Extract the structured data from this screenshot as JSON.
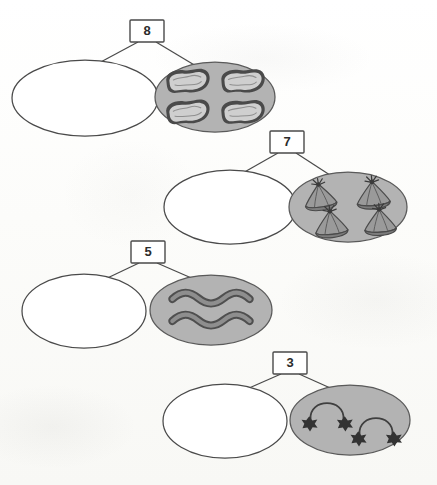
{
  "page": {
    "kind": "number-bond-worksheet",
    "background_color": "#fdfdfb",
    "ink_color": "#3a3a3a",
    "shaded_group_fill": "#b3b3b3",
    "empty_group_fill": "#ffffff"
  },
  "bonds": [
    {
      "id": "bond-8",
      "total": "8",
      "total_box": {
        "x": 130,
        "y": 20,
        "width": 34,
        "height": 22
      },
      "empty_part": {
        "cx": 85,
        "cy": 98,
        "rx": 73,
        "ry": 38,
        "label": ""
      },
      "shaded_part": {
        "cx": 215,
        "cy": 97,
        "rx": 60,
        "ry": 35,
        "icon": "bean-pastry-icon",
        "count": 4,
        "objects": [
          {
            "cx": 188,
            "cy": 82
          },
          {
            "cx": 243,
            "cy": 82
          },
          {
            "cx": 188,
            "cy": 113
          },
          {
            "cx": 243,
            "cy": 113
          }
        ]
      }
    },
    {
      "id": "bond-7",
      "total": "7",
      "total_box": {
        "x": 270,
        "y": 131,
        "width": 34,
        "height": 22
      },
      "empty_part": {
        "cx": 230,
        "cy": 207,
        "rx": 66,
        "ry": 37,
        "label": ""
      },
      "shaded_part": {
        "cx": 348,
        "cy": 207,
        "rx": 59,
        "ry": 35,
        "icon": "cone-bundle-icon",
        "count": 4,
        "objects": [
          {
            "cx": 320,
            "cy": 194
          },
          {
            "cx": 372,
            "cy": 192
          },
          {
            "cx": 331,
            "cy": 221
          },
          {
            "cx": 379,
            "cy": 219
          }
        ]
      }
    },
    {
      "id": "bond-5",
      "total": "5",
      "total_box": {
        "x": 131,
        "y": 241,
        "width": 34,
        "height": 22
      },
      "empty_part": {
        "cx": 84,
        "cy": 311,
        "rx": 62,
        "ry": 37,
        "label": ""
      },
      "shaded_part": {
        "cx": 211,
        "cy": 310,
        "rx": 61,
        "ry": 35,
        "icon": "wavy-ribbon-icon",
        "count": 2,
        "objects": [
          {
            "cx": 211,
            "cy": 299
          },
          {
            "cx": 211,
            "cy": 320
          }
        ]
      }
    },
    {
      "id": "bond-3",
      "total": "3",
      "total_box": {
        "x": 273,
        "y": 352,
        "width": 34,
        "height": 22
      },
      "empty_part": {
        "cx": 225,
        "cy": 421,
        "rx": 62,
        "ry": 37,
        "label": ""
      },
      "shaded_part": {
        "cx": 350,
        "cy": 420,
        "rx": 60,
        "ry": 35,
        "icon": "skipping-rope-icon",
        "count": 2,
        "objects": [
          {
            "cx": 327,
            "cy": 413
          },
          {
            "cx": 375,
            "cy": 428
          }
        ]
      }
    }
  ]
}
